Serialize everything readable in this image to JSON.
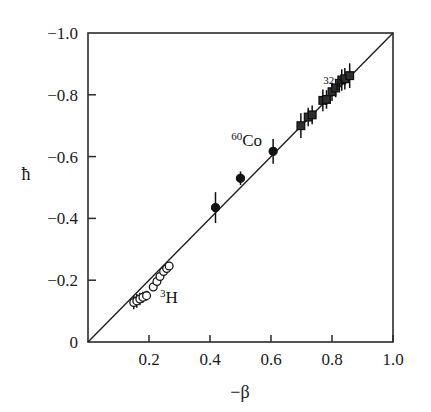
{
  "figure": {
    "background_color": "#ffffff",
    "ink_color": "#1a1a1a"
  },
  "chart_data": {
    "type": "scatter",
    "title": "",
    "subtitle": "",
    "xlabel": "−β",
    "ylabel": "ħ",
    "xlim": [
      0.0,
      1.0
    ],
    "ylim": [
      0.0,
      -1.0
    ],
    "y_axis_inverted": true,
    "grid": false,
    "legend": "none",
    "xticks": [
      0.2,
      0.4,
      0.6,
      0.8,
      1.0
    ],
    "xtick_labels": [
      "0.2",
      "0.4",
      "0.6",
      "0.8",
      "1.0"
    ],
    "yticks": [
      -1.0,
      -0.8,
      -0.6,
      -0.4,
      -0.2,
      0.0
    ],
    "ytick_labels": [
      "−1.0",
      "−0.8",
      "−0.6",
      "−0.4",
      "−0.2",
      "0"
    ],
    "reference_line": {
      "name": "identity-line",
      "description": "h-bar = -beta",
      "x0": 0.0,
      "y0": 0.0,
      "x1": 1.0,
      "y1": -1.0
    },
    "annotations": [
      {
        "name": "label-co60",
        "superscript": "60",
        "text": "Co",
        "x": 0.52,
        "y": -0.635
      },
      {
        "name": "label-p32",
        "superscript": "32",
        "text": "P",
        "x": 0.805,
        "y": -0.815
      },
      {
        "name": "label-h3",
        "superscript": "3",
        "text": "H",
        "x": 0.265,
        "y": -0.125
      }
    ],
    "series": [
      {
        "name": "3H",
        "marker": "open-circle",
        "marker_size": 5,
        "points": [
          {
            "x": 0.15,
            "y": -0.128,
            "yerr": 0.022
          },
          {
            "x": 0.16,
            "y": -0.133,
            "yerr": 0.022
          },
          {
            "x": 0.17,
            "y": -0.139,
            "yerr": 0.02
          },
          {
            "x": 0.18,
            "y": -0.145,
            "yerr": 0.018
          },
          {
            "x": 0.192,
            "y": -0.15,
            "yerr": 0.016
          },
          {
            "x": 0.214,
            "y": -0.178,
            "yerr": 0.0
          },
          {
            "x": 0.226,
            "y": -0.196,
            "yerr": 0.0
          },
          {
            "x": 0.236,
            "y": -0.212,
            "yerr": 0.0
          },
          {
            "x": 0.248,
            "y": -0.228,
            "yerr": 0.0
          },
          {
            "x": 0.258,
            "y": -0.238,
            "yerr": 0.0
          },
          {
            "x": 0.266,
            "y": -0.246,
            "yerr": 0.0
          }
        ]
      },
      {
        "name": "60Co",
        "marker": "filled-circle",
        "marker_size": 5,
        "points": [
          {
            "x": 0.418,
            "y": -0.435,
            "yerr": 0.05
          },
          {
            "x": 0.5,
            "y": -0.53,
            "yerr": 0.022
          },
          {
            "x": 0.607,
            "y": -0.617,
            "yerr": 0.04
          }
        ]
      },
      {
        "name": "32P",
        "marker": "filled-square",
        "marker_size": 6,
        "points": [
          {
            "x": 0.698,
            "y": -0.7,
            "yerr": 0.04
          },
          {
            "x": 0.722,
            "y": -0.728,
            "yerr": 0.03
          },
          {
            "x": 0.735,
            "y": -0.735,
            "yerr": 0.03
          },
          {
            "x": 0.77,
            "y": -0.782,
            "yerr": 0.035
          },
          {
            "x": 0.782,
            "y": -0.785,
            "yerr": 0.03
          },
          {
            "x": 0.8,
            "y": -0.81,
            "yerr": 0.03
          },
          {
            "x": 0.812,
            "y": -0.822,
            "yerr": 0.03
          },
          {
            "x": 0.832,
            "y": -0.848,
            "yerr": 0.035
          },
          {
            "x": 0.842,
            "y": -0.852,
            "yerr": 0.035
          },
          {
            "x": 0.858,
            "y": -0.862,
            "yerr": 0.04
          }
        ]
      }
    ]
  }
}
